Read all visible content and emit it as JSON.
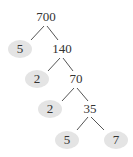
{
  "diagram": {
    "type": "factor-tree",
    "root": "700",
    "prime_fill": "#e4e4e4",
    "nodes": [
      {
        "id": "n700",
        "label": "700",
        "kind": "composite",
        "x": 46,
        "y": 17
      },
      {
        "id": "p5a",
        "label": "5",
        "kind": "prime",
        "x": 20,
        "y": 49
      },
      {
        "id": "n140",
        "label": "140",
        "kind": "composite",
        "x": 62,
        "y": 49
      },
      {
        "id": "p2a",
        "label": "2",
        "kind": "prime",
        "x": 37,
        "y": 79
      },
      {
        "id": "n70",
        "label": "70",
        "kind": "composite",
        "x": 76,
        "y": 79
      },
      {
        "id": "p2b",
        "label": "2",
        "kind": "prime",
        "x": 50,
        "y": 109
      },
      {
        "id": "n35",
        "label": "35",
        "kind": "composite",
        "x": 90,
        "y": 109
      },
      {
        "id": "p5b",
        "label": "5",
        "kind": "prime",
        "x": 67,
        "y": 140
      },
      {
        "id": "p7",
        "label": "7",
        "kind": "prime",
        "x": 116,
        "y": 140
      }
    ],
    "edges": [
      {
        "from": "700",
        "to": "5",
        "x1": 44,
        "y1": 26,
        "x2": 31,
        "y2": 40
      },
      {
        "from": "700",
        "to": "140",
        "x1": 47,
        "y1": 26,
        "x2": 58,
        "y2": 40
      },
      {
        "from": "140",
        "to": "2",
        "x1": 60,
        "y1": 58,
        "x2": 48,
        "y2": 71
      },
      {
        "from": "140",
        "to": "70",
        "x1": 63,
        "y1": 58,
        "x2": 73,
        "y2": 71
      },
      {
        "from": "70",
        "to": "2",
        "x1": 74,
        "y1": 88,
        "x2": 62,
        "y2": 101
      },
      {
        "from": "70",
        "to": "35",
        "x1": 77,
        "y1": 88,
        "x2": 88,
        "y2": 101
      },
      {
        "from": "35",
        "to": "5",
        "x1": 88,
        "y1": 117,
        "x2": 77,
        "y2": 130
      },
      {
        "from": "35",
        "to": "7",
        "x1": 91,
        "y1": 117,
        "x2": 104,
        "y2": 130
      }
    ]
  }
}
